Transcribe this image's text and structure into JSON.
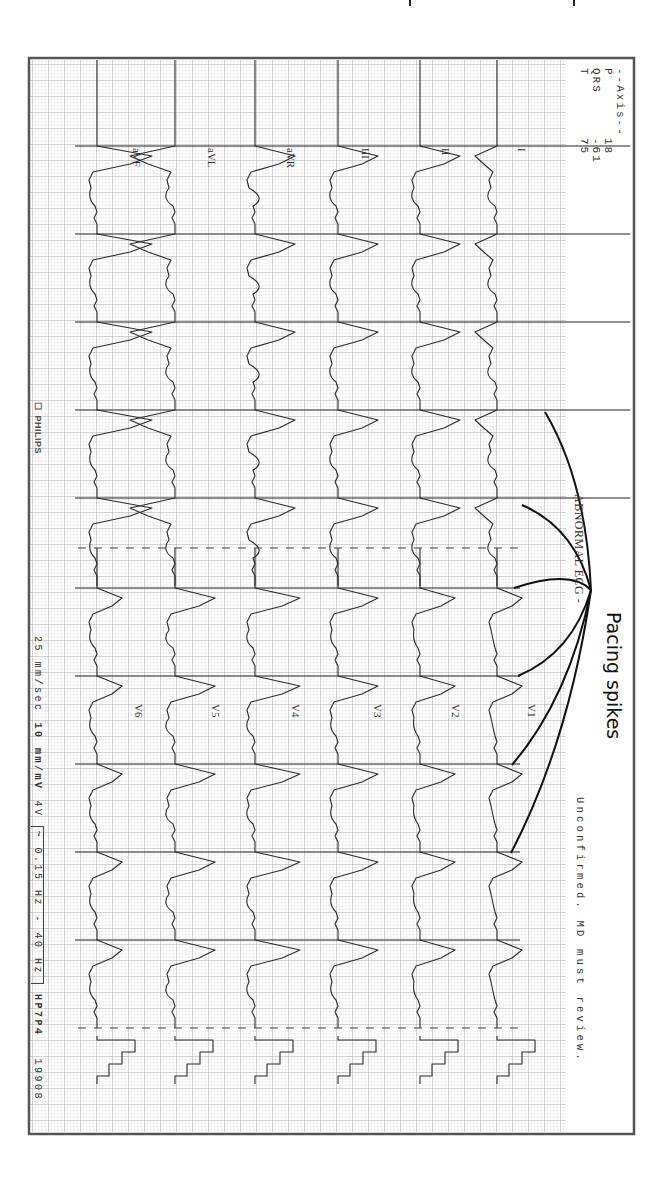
{
  "annotation": {
    "label": "Pacing spikes",
    "arrow_color": "#111111",
    "arrow_origin": [
      591,
      590
    ],
    "arrow_targets": [
      [
        545,
        412
      ],
      [
        522,
        505
      ],
      [
        514,
        588
      ],
      [
        518,
        676
      ],
      [
        512,
        765
      ],
      [
        511,
        853
      ]
    ]
  },
  "header": {
    "axis_title": "--Axis--",
    "axis": [
      {
        "name": "P",
        "value": "18"
      },
      {
        "name": "QRS",
        "value": "-61"
      },
      {
        "name": "T",
        "value": "75"
      }
    ],
    "interpretation": "ABNORMAL ECG -",
    "disclaimer": "Unconfirmed. MD must review."
  },
  "footer": {
    "brand": "PHILIPS",
    "speed": "25 mm/sec",
    "gain": "10 mm/mV",
    "lead_gain": "4V",
    "filter": "~ 0.15 Hz - 40 Hz",
    "device": "HP7P4",
    "code": "19908"
  },
  "colors": {
    "paper": "#f4f4f4",
    "grid_minor": "#c9c9c9",
    "grid_major": "#9a9a9a",
    "trace": "#2b2b2b",
    "frame": "#555555"
  },
  "chart_data": {
    "type": "line",
    "xlabel": "time (25 mm/sec)",
    "ylabel": "amplitude (10 mm/mV)",
    "grid": true,
    "layout": "6 rows x 2 columns",
    "columns": [
      {
        "leads": [
          "I",
          "II",
          "III",
          "aVR",
          "aVL",
          "aVF"
        ]
      },
      {
        "leads": [
          "V1",
          "V2",
          "V3",
          "V4",
          "V5",
          "V6"
        ]
      }
    ],
    "beats_per_column": 5,
    "beat_interval_px": 88,
    "axis_deg": {
      "P": 18,
      "QRS": -61,
      "T": 75
    },
    "pacing_spikes": "visible before each QRS complex",
    "calibration_pulse": "1 mV step at end of each row"
  }
}
